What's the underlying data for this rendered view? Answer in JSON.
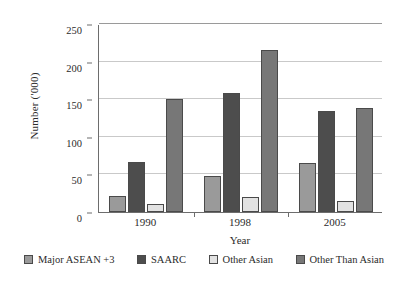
{
  "chart_data": {
    "type": "bar",
    "title": "",
    "xlabel": "Year",
    "ylabel": "Number ('000)",
    "categories": [
      "1990",
      "1998",
      "2005"
    ],
    "ylim": [
      0,
      250
    ],
    "yticks": [
      0,
      50,
      100,
      150,
      200,
      250
    ],
    "grid": true,
    "legend_position": "bottom",
    "series": [
      {
        "name": "Major ASEAN +3",
        "color": "#9a9a9a",
        "values": [
          21,
          48,
          65
        ]
      },
      {
        "name": "SAARC",
        "color": "#4d4d4d",
        "values": [
          66,
          158,
          134
        ]
      },
      {
        "name": "Other Asian",
        "color": "#e2e2e2",
        "values": [
          10,
          20,
          15
        ]
      },
      {
        "name": "Other Than Asian",
        "color": "#777777",
        "values": [
          150,
          215,
          138
        ]
      }
    ]
  },
  "axis": {
    "y_title": "Number ('000)",
    "x_title": "Year",
    "y_tick_labels": [
      "0",
      "50",
      "100",
      "150",
      "200",
      "250"
    ],
    "x_tick_labels": [
      "1990",
      "1998",
      "2005"
    ]
  },
  "legend": {
    "items": [
      {
        "label": "Major ASEAN +3"
      },
      {
        "label": "SAARC"
      },
      {
        "label": "Other Asian"
      },
      {
        "label": "Other Than Asian"
      }
    ]
  }
}
